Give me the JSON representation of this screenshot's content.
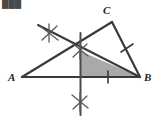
{
  "figure": {
    "background_color": "#ffffff",
    "stroke_color": "#3a3a3a",
    "arc_color": "#5a5a5a",
    "shade_color": "#a9a9a9",
    "label_color": "#222222",
    "width": 157,
    "height": 118
  },
  "cropped_header": {
    "text": "███",
    "note": "partially cut-off text at top-left edge"
  },
  "vertices": [
    {
      "name": "A",
      "label": "A",
      "x": 22,
      "y": 77
    },
    {
      "name": "B",
      "label": "B",
      "x": 140,
      "y": 77
    },
    {
      "name": "C",
      "label": "C",
      "x": 112,
      "y": 22
    }
  ],
  "vertex_labels": [
    {
      "name": "label-a",
      "text": "A",
      "x": 8,
      "y": 81
    },
    {
      "name": "label-b",
      "text": "B",
      "x": 144,
      "y": 81
    },
    {
      "name": "label-c",
      "text": "C",
      "x": 103,
      "y": 14
    }
  ],
  "sides": [
    {
      "name": "side-ab",
      "from": "A",
      "to": "B",
      "x1": 22,
      "y1": 77,
      "x2": 140,
      "y2": 77
    },
    {
      "name": "side-ac",
      "from": "A",
      "to": "C",
      "x1": 22,
      "y1": 77,
      "x2": 112,
      "y2": 22
    },
    {
      "name": "side-cb",
      "from": "C",
      "to": "B",
      "x1": 112,
      "y1": 22,
      "x2": 140,
      "y2": 77
    }
  ],
  "construction": {
    "perpendicular_bisector": {
      "name": "perpendicular-bisector-line",
      "x1": 80.5,
      "y1": 33,
      "x2": 80.5,
      "y2": 115,
      "orientation": "vertical"
    },
    "cevian_line": {
      "name": "cevian-construction-line",
      "x1": 38,
      "y1": 25,
      "x2": 140,
      "y2": 77,
      "orientation": "diagonal"
    },
    "arc_marks": [
      {
        "name": "arc-intersection-upper",
        "cx": 49,
        "cy": 33,
        "strokes": [
          {
            "x1": 40,
            "y1": 26,
            "x2": 58,
            "y2": 40
          },
          {
            "x1": 42,
            "y1": 40,
            "x2": 57,
            "y2": 26
          },
          {
            "x1": 49,
            "y1": 24,
            "x2": 49,
            "y2": 42
          }
        ]
      },
      {
        "name": "arc-intersection-middle",
        "cx": 80,
        "cy": 50,
        "strokes": [
          {
            "x1": 72,
            "y1": 43,
            "x2": 88,
            "y2": 56
          },
          {
            "x1": 73,
            "y1": 57,
            "x2": 87,
            "y2": 44
          },
          {
            "x1": 80,
            "y1": 41,
            "x2": 80,
            "y2": 59
          }
        ]
      },
      {
        "name": "arc-intersection-lower",
        "cx": 80,
        "cy": 102,
        "strokes": [
          {
            "x1": 72,
            "y1": 95,
            "x2": 88,
            "y2": 108
          },
          {
            "x1": 73,
            "y1": 109,
            "x2": 87,
            "y2": 96
          },
          {
            "x1": 80,
            "y1": 93,
            "x2": 80,
            "y2": 111
          }
        ]
      }
    ]
  },
  "tick_marks": [
    {
      "name": "tick-on-ab",
      "on_segment": "AB",
      "x1": 108,
      "y1": 71,
      "x2": 108,
      "y2": 83
    },
    {
      "name": "tick-on-cb",
      "on_segment": "CB",
      "x1": 121,
      "y1": 52,
      "x2": 133,
      "y2": 44
    }
  ],
  "shaded_region": {
    "name": "shaded-triangle-region",
    "vertices": "80,51 140,77 80,77",
    "fill": "#a9a9a9",
    "description": "shaded right triangle bounded by the perpendicular bisector, side AB and the cevian to B"
  }
}
